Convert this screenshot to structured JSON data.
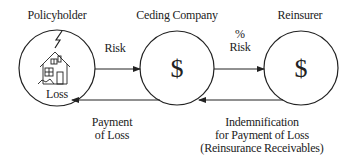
{
  "nodes": {
    "policyholder": {
      "title": "Policyholder",
      "inner_label": "Loss",
      "icon": "house-with-lightning-icon"
    },
    "ceding_company": {
      "title": "Ceding Company",
      "symbol": "$"
    },
    "reinsurer": {
      "title": "Reinsurer",
      "symbol": "$"
    }
  },
  "edges": {
    "risk": {
      "label": "Risk"
    },
    "percent_risk": {
      "line1": "%",
      "line2": "Risk"
    },
    "payment_of_loss": {
      "line1": "Payment",
      "line2": "of Loss"
    },
    "indemnification": {
      "line1": "Indemnification",
      "line2": "for Payment of Loss",
      "line3": "(Reinsurance Receivables)"
    }
  },
  "colors": {
    "stroke": "#222222",
    "background": "#ffffff"
  }
}
